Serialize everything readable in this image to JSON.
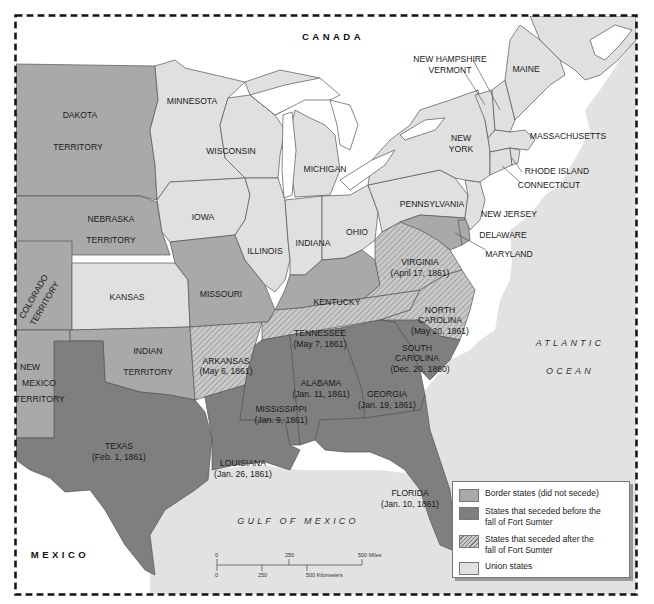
{
  "map": {
    "title": "",
    "colors": {
      "border": "#a9a9a9",
      "seceded_before": "#7f7f7f",
      "seceded_after_hatch": "#bdbdbd",
      "union": "#e0e0e0",
      "water": "#e2e2e2",
      "foreign": "#ffffff",
      "frame": "#111111"
    },
    "countries": {
      "canada": "CANADA",
      "mexico": "MEXICO"
    },
    "water_bodies": {
      "atlantic_line1": "ATLANTIC",
      "atlantic_line2": "OCEAN",
      "gulf": "GULF OF MEXICO"
    },
    "regions": {
      "dakota": {
        "name1": "DAKOTA",
        "name2": "TERRITORY",
        "status": "border"
      },
      "nebraska": {
        "name1": "NEBRASKA",
        "name2": "TERRITORY",
        "status": "border"
      },
      "colorado": {
        "name1": "COLORADO",
        "name2": "TERRITORY",
        "status": "border"
      },
      "kansas": {
        "name": "KANSAS",
        "status": "union"
      },
      "new_mexico": {
        "name1": "NEW",
        "name2": "MEXICO",
        "name3": "TERRITORY",
        "status": "border"
      },
      "indian": {
        "name1": "INDIAN",
        "name2": "TERRITORY",
        "status": "border"
      },
      "texas": {
        "name": "TEXAS",
        "date": "(Feb. 1, 1861)",
        "status": "seceded_before"
      },
      "minnesota": {
        "name": "MINNESOTA",
        "status": "union"
      },
      "iowa": {
        "name": "IOWA",
        "status": "union"
      },
      "missouri": {
        "name": "MISSOURI",
        "status": "border"
      },
      "arkansas": {
        "name": "ARKANSAS",
        "date": "(May 6, 1861)",
        "status": "seceded_after"
      },
      "louisiana": {
        "name": "LOUISIANA",
        "date": "(Jan. 26, 1861)",
        "status": "seceded_before"
      },
      "wisconsin": {
        "name": "WISCONSIN",
        "status": "union"
      },
      "illinois": {
        "name": "ILLINOIS",
        "status": "union"
      },
      "michigan": {
        "name": "MICHIGAN",
        "status": "union"
      },
      "indiana": {
        "name": "INDIANA",
        "status": "union"
      },
      "ohio": {
        "name": "OHIO",
        "status": "union"
      },
      "kentucky": {
        "name": "KENTUCKY",
        "status": "border"
      },
      "tennessee": {
        "name": "TENNESSEE",
        "date": "(May 7, 1861)",
        "status": "seceded_after"
      },
      "mississippi": {
        "name": "MISSISSIPPI",
        "date": "(Jan. 9, 1861)",
        "status": "seceded_before"
      },
      "alabama": {
        "name": "ALABAMA",
        "date": "(Jan. 11, 1861)",
        "status": "seceded_before"
      },
      "georgia": {
        "name": "GEORGIA",
        "date": "(Jan. 19, 1861)",
        "status": "seceded_before"
      },
      "florida": {
        "name": "FLORIDA",
        "date": "(Jan. 10, 1861)",
        "status": "seceded_before"
      },
      "south_carolina": {
        "name1": "SOUTH",
        "name2": "CAROLINA",
        "date": "(Dec. 20, 1860)",
        "status": "seceded_before"
      },
      "north_carolina": {
        "name1": "NORTH",
        "name2": "CAROLINA",
        "date": "(May 20, 1861)",
        "status": "seceded_after"
      },
      "virginia": {
        "name": "VIRGINIA",
        "date": "(April 17, 1861)",
        "status": "seceded_after"
      },
      "maryland": {
        "name": "MARYLAND",
        "status": "border"
      },
      "delaware": {
        "name": "DELAWARE",
        "status": "border"
      },
      "pennsylvania": {
        "name": "PENNSYLVANIA",
        "status": "union"
      },
      "new_jersey": {
        "name": "NEW JERSEY",
        "status": "union"
      },
      "new_york": {
        "name1": "NEW",
        "name2": "YORK",
        "status": "union"
      },
      "connecticut": {
        "name": "CONNECTICUT",
        "status": "union"
      },
      "rhode_island": {
        "name": "RHODE ISLAND",
        "status": "union"
      },
      "massachusetts": {
        "name": "MASSACHUSETTS",
        "status": "union"
      },
      "vermont": {
        "name": "VERMONT",
        "status": "union"
      },
      "new_hampshire": {
        "name": "NEW HAMPSHIRE",
        "status": "union"
      },
      "maine": {
        "name": "MAINE",
        "status": "union"
      }
    },
    "scale_bar": {
      "miles_ticks": [
        "0",
        "250",
        "500 Miles"
      ],
      "km_ticks": [
        "0",
        "250",
        "500 Kilometers"
      ]
    },
    "legend": {
      "items": [
        {
          "label": "Border states (did not secede)",
          "type": "border"
        },
        {
          "label": "States that seceded before the fall of Fort Sumter",
          "type": "seceded_before"
        },
        {
          "label": "States that seceded after the fall of Fort Sumter",
          "type": "seceded_after"
        },
        {
          "label": "Union states",
          "type": "union"
        }
      ]
    }
  }
}
